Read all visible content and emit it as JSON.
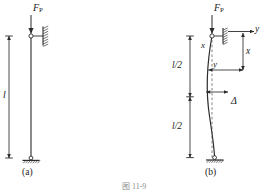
{
  "figure": {
    "bottom_caption": "图 11-9",
    "panels": [
      {
        "id": "a",
        "caption": "(a)",
        "force_label": "F",
        "force_subscript": "P",
        "length_label": "l",
        "description": "straight-column-pinned-top-fixed-base"
      },
      {
        "id": "b",
        "caption": "(b)",
        "force_label": "F",
        "force_subscript": "P",
        "half_length_label_upper": "l/2",
        "half_length_label_lower": "l/2",
        "axis_y_label": "y",
        "axis_x_label": "x",
        "deflection_label_y": "y",
        "deflection_label_x": "x",
        "max_deflection_label": "Δ",
        "description": "buckled-column-deflection-diagram"
      }
    ]
  },
  "colors": {
    "line": "#2b2b2b",
    "hatch": "#3a3a3a",
    "dashed": "#5a5a5a",
    "caption_faint": "#9a9a9a"
  }
}
